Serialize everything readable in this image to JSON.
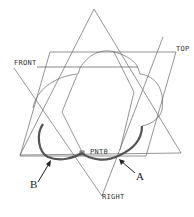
{
  "diagram": {
    "labels": {
      "top": "TOP",
      "front": "FRONT",
      "right": "RIGHT",
      "point": "PNT0",
      "a": "A",
      "b": "B"
    },
    "colors": {
      "line": "#555555",
      "bold_curve": "#555555",
      "background": "#ffffff"
    }
  }
}
